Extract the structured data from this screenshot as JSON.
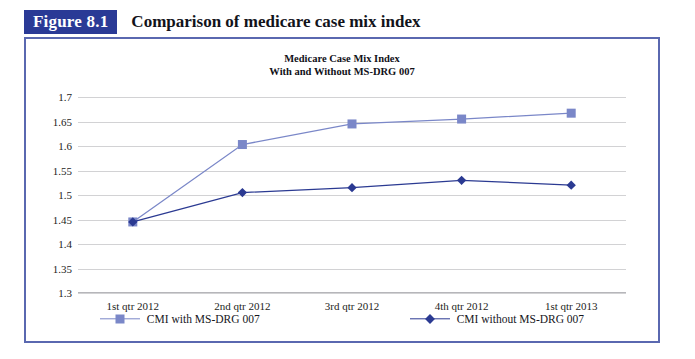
{
  "figure": {
    "tag": "Figure 8.1",
    "caption": "Comparison of medicare case mix index"
  },
  "colors": {
    "tag_background": "#2a3a96",
    "frame_border": "#5a68b0",
    "series_with": "#7a87c8",
    "series_without": "#2b3a92",
    "gridline": "#d2d2d4"
  },
  "chart_data": {
    "type": "line",
    "title": "Medicare Case Mix Index",
    "subtitle": "With and Without MS-DRG 007",
    "xlabel": "",
    "ylabel": "",
    "ylim": [
      1.3,
      1.7
    ],
    "ytick_step": 0.05,
    "yticks": [
      "1.7",
      "1.65",
      "1.6",
      "1.55",
      "1.5",
      "1.45",
      "1.4",
      "1.35",
      "1.3"
    ],
    "ytick_values": [
      1.7,
      1.65,
      1.6,
      1.55,
      1.5,
      1.45,
      1.4,
      1.35,
      1.3
    ],
    "grid": true,
    "legend_position": "bottom",
    "categories": [
      "1st qtr 2012",
      "2nd qtr 2012",
      "3rd qtr 2012",
      "4th qtr 2012",
      "1st qtr 2013"
    ],
    "series": [
      {
        "name": "CMI with MS-DRG 007",
        "marker": "square",
        "color": "#7a87c8",
        "values": [
          1.445,
          1.603,
          1.645,
          1.655,
          1.667
        ]
      },
      {
        "name": "CMI without MS-DRG 007",
        "marker": "diamond",
        "color": "#2b3a92",
        "values": [
          1.445,
          1.505,
          1.515,
          1.53,
          1.52
        ]
      }
    ]
  }
}
